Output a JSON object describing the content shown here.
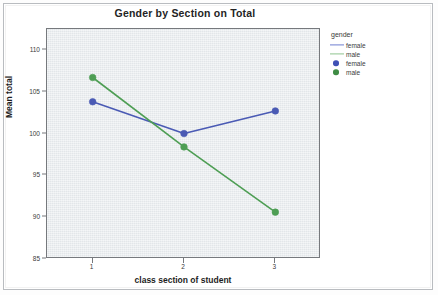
{
  "chart_data": {
    "type": "line",
    "title": "Gender by Section on Total",
    "xlabel": "class section of student",
    "ylabel": "Mean total",
    "categories": [
      "1",
      "2",
      "3"
    ],
    "xticklabels": [
      "1",
      "2",
      "3"
    ],
    "yticklabels": [
      "85",
      "90",
      "95",
      "100",
      "105",
      "110"
    ],
    "yticks": [
      85,
      90,
      95,
      100,
      105,
      110
    ],
    "ylim": [
      85,
      112.5
    ],
    "xlim": [
      0.5,
      3.5
    ],
    "grid": false,
    "legend_title": "gender",
    "legend_position": "right",
    "series": [
      {
        "name": "female",
        "color": "#4a5ab4",
        "marker": "circle",
        "values": [
          103.8,
          100.0,
          102.7
        ]
      },
      {
        "name": "male",
        "color": "#4e9e54",
        "marker": "circle",
        "values": [
          106.7,
          98.4,
          90.6
        ]
      }
    ],
    "legend_entries": [
      {
        "label": "female",
        "kind": "line",
        "color": "#6f7fd0"
      },
      {
        "label": "male",
        "kind": "line",
        "color": "#8fc58f"
      },
      {
        "label": "female",
        "kind": "dot",
        "color": "#3f51b5"
      },
      {
        "label": "male",
        "kind": "dot",
        "color": "#3f8c45"
      }
    ]
  },
  "style": {
    "panel_background": "#e8ecef",
    "panel_border": "#76797d",
    "page_background": "#ffffff",
    "text_color": "#1d1d1d"
  }
}
